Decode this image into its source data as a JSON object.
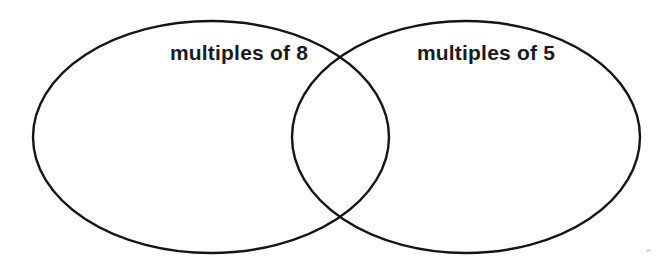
{
  "diagram": {
    "type": "venn-diagram",
    "background_color": "#ffffff",
    "stroke_color": "#151515",
    "text_color": "#1a1a1a",
    "left_set": {
      "label": "multiples of 8"
    },
    "right_set": {
      "label": "multiples of 5"
    }
  }
}
